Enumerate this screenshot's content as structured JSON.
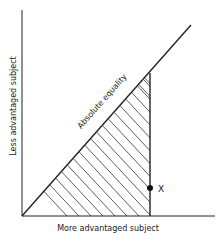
{
  "diagram": {
    "x_axis_label": "More advantaged subject",
    "y_axis_label": "Less advantaged subject",
    "diagonal_label": "Absolute equality",
    "point_label": "X",
    "colors": {
      "line": "#222222",
      "hatch": "#333333",
      "background": "#ffffff"
    }
  }
}
